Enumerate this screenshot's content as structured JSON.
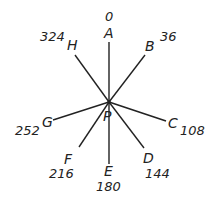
{
  "center": {
    "label": "P"
  },
  "rays": [
    {
      "label": "A",
      "angle": "0"
    },
    {
      "label": "B",
      "angle": "36"
    },
    {
      "label": "C",
      "angle": "108"
    },
    {
      "label": "D",
      "angle": "144"
    },
    {
      "label": "E",
      "angle": "180"
    },
    {
      "label": "F",
      "angle": "216"
    },
    {
      "label": "G",
      "angle": "252"
    },
    {
      "label": "H",
      "angle": "324"
    }
  ]
}
